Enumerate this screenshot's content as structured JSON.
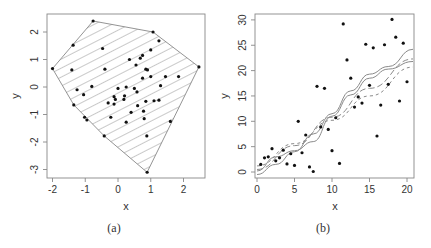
{
  "chart_data": [
    {
      "type": "scatter",
      "title": "",
      "caption": "(a)",
      "xlabel": "x",
      "ylabel": "y",
      "xlim": [
        -2.15,
        2.6
      ],
      "ylim": [
        -3.3,
        2.6
      ],
      "xticks": [
        -2,
        -1,
        0,
        1,
        2
      ],
      "yticks": [
        -3,
        -2,
        -1,
        0,
        1,
        2
      ],
      "grid": false,
      "annotation": "convex hull of points, hatched with diagonal lines",
      "points": [
        [
          -0.76,
          2.4
        ],
        [
          1.07,
          2.0
        ],
        [
          2.47,
          0.73
        ],
        [
          0.89,
          -3.1
        ],
        [
          -2.0,
          0.67
        ],
        [
          -1.37,
          1.52
        ],
        [
          -1.41,
          0.62
        ],
        [
          -1.35,
          -0.65
        ],
        [
          -0.42,
          -1.78
        ],
        [
          1.6,
          -1.25
        ],
        [
          -0.47,
          1.4
        ],
        [
          1.25,
          1.68
        ],
        [
          1.0,
          1.35
        ],
        [
          0.35,
          1.0
        ],
        [
          0.68,
          1.05
        ],
        [
          0.75,
          1.15
        ],
        [
          0.55,
          0.8
        ],
        [
          -0.4,
          0.65
        ],
        [
          0.85,
          0.65
        ],
        [
          0.9,
          0.62
        ],
        [
          1.0,
          0.38
        ],
        [
          1.45,
          0.38
        ],
        [
          1.85,
          0.38
        ],
        [
          0.75,
          0.32
        ],
        [
          -0.8,
          0.02
        ],
        [
          -1.25,
          -0.1
        ],
        [
          -1.05,
          -0.28
        ],
        [
          0.0,
          -0.05
        ],
        [
          0.25,
          0.0
        ],
        [
          0.5,
          -0.05
        ],
        [
          1.3,
          0.05
        ],
        [
          0.58,
          -0.18
        ],
        [
          -0.12,
          -0.35
        ],
        [
          -0.08,
          -0.45
        ],
        [
          0.2,
          -0.32
        ],
        [
          0.18,
          -0.45
        ],
        [
          -0.3,
          -0.58
        ],
        [
          -0.12,
          -0.62
        ],
        [
          0.6,
          -0.68
        ],
        [
          0.85,
          -0.52
        ],
        [
          1.1,
          -0.5
        ],
        [
          1.25,
          -0.48
        ],
        [
          0.4,
          -0.92
        ],
        [
          0.78,
          -0.88
        ],
        [
          -0.22,
          -1.1
        ],
        [
          0.25,
          -1.28
        ],
        [
          0.8,
          -1.15
        ],
        [
          -1.02,
          -1.1
        ],
        [
          -0.95,
          -1.2
        ],
        [
          0.88,
          -1.78
        ]
      ],
      "hull": [
        [
          -0.76,
          2.4
        ],
        [
          1.07,
          2.0
        ],
        [
          2.47,
          0.73
        ],
        [
          0.89,
          -3.1
        ],
        [
          -0.42,
          -1.78
        ],
        [
          -1.35,
          -0.65
        ],
        [
          -2.0,
          0.67
        ]
      ]
    },
    {
      "type": "scatter",
      "title": "",
      "caption": "(b)",
      "xlabel": "x",
      "ylabel": "y",
      "xlim": [
        -0.3,
        20.9
      ],
      "ylim": [
        -1.2,
        31.0
      ],
      "xticks": [
        0,
        5,
        10,
        15,
        20
      ],
      "yticks": [
        0,
        5,
        10,
        15,
        20,
        25,
        30
      ],
      "grid": false,
      "annotation": "scatter with four fitted curves (two solid, two dashed)",
      "points": [
        [
          0.5,
          1.5
        ],
        [
          1.0,
          2.8
        ],
        [
          1.5,
          3.0
        ],
        [
          2.0,
          4.6
        ],
        [
          2.5,
          2.2
        ],
        [
          3.0,
          2.8
        ],
        [
          3.5,
          4.3
        ],
        [
          4.0,
          1.6
        ],
        [
          4.5,
          3.6
        ],
        [
          5.0,
          1.3
        ],
        [
          5.5,
          10.0
        ],
        [
          6.0,
          3.8
        ],
        [
          6.5,
          7.3
        ],
        [
          7.0,
          1.0
        ],
        [
          7.5,
          0.1
        ],
        [
          8.0,
          16.9
        ],
        [
          8.5,
          8.9
        ],
        [
          9.0,
          16.5
        ],
        [
          9.5,
          8.4
        ],
        [
          10.0,
          4.2
        ],
        [
          10.5,
          10.7
        ],
        [
          11.0,
          1.7
        ],
        [
          11.5,
          29.2
        ],
        [
          12.0,
          22.1
        ],
        [
          12.5,
          18.5
        ],
        [
          13.0,
          12.8
        ],
        [
          13.5,
          14.8
        ],
        [
          14.0,
          13.6
        ],
        [
          14.5,
          25.2
        ],
        [
          15.0,
          17.1
        ],
        [
          15.5,
          24.5
        ],
        [
          16.0,
          7.1
        ],
        [
          16.5,
          13.2
        ],
        [
          17.0,
          25.1
        ],
        [
          17.5,
          17.3
        ],
        [
          18.0,
          30.1
        ],
        [
          18.5,
          26.6
        ],
        [
          19.0,
          14.0
        ],
        [
          19.5,
          25.4
        ],
        [
          20.0,
          17.8
        ]
      ],
      "series": [
        {
          "name": "solid-curve-1",
          "style": "solid",
          "x": [
            0,
            2.5,
            5,
            7.5,
            10,
            12.5,
            15,
            17.5,
            20.8
          ],
          "y": [
            -0.5,
            1.5,
            4.0,
            7.5,
            11.5,
            16.0,
            19.3,
            20.8,
            24.2
          ]
        },
        {
          "name": "solid-curve-2",
          "style": "solid",
          "x": [
            0,
            2.5,
            5,
            7.5,
            10,
            12.5,
            15,
            17.5,
            20.8
          ],
          "y": [
            0.2,
            3.0,
            4.2,
            6.0,
            11.0,
            15.2,
            18.5,
            20.3,
            21.8
          ]
        },
        {
          "name": "dashed-curve-1",
          "style": "dashed",
          "x": [
            0,
            5,
            10,
            15,
            20.8
          ],
          "y": [
            0.5,
            5.2,
            10.8,
            16.5,
            22.3
          ]
        },
        {
          "name": "dashed-curve-2",
          "style": "dashed",
          "x": [
            0,
            5,
            10,
            15,
            20.8
          ],
          "y": [
            1.2,
            5.6,
            10.2,
            15.0,
            20.7
          ]
        }
      ]
    }
  ],
  "panels": {
    "a": {
      "caption": "(a)",
      "xlabel": "x",
      "ylabel": "y",
      "xticks": [
        "-2",
        "-1",
        "0",
        "1",
        "2"
      ],
      "yticks": [
        "-3",
        "-2",
        "-1",
        "0",
        "1",
        "2"
      ]
    },
    "b": {
      "caption": "(b)",
      "xlabel": "x",
      "ylabel": "y",
      "xticks": [
        "0",
        "5",
        "10",
        "15",
        "20"
      ],
      "yticks": [
        "0",
        "5",
        "10",
        "15",
        "20",
        "25",
        "30"
      ]
    }
  },
  "colors": {
    "frame": "#888888",
    "points": "#111111",
    "hatch": "#777777",
    "curves": "#8a8a8a"
  }
}
